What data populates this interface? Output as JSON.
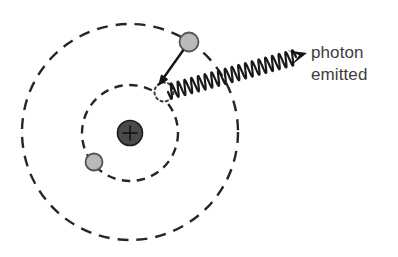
{
  "figure": {
    "background_color": "#ffffff",
    "width": 398,
    "height": 257
  },
  "labels": {
    "photon_line1": "photon",
    "photon_line2": "emitted",
    "nucleus_charge": "+"
  },
  "colors": {
    "orbit_stroke": "#262626",
    "nucleus_fill": "#4a4a4a",
    "nucleus_stroke": "#1c1c1c",
    "electron_fill": "#b9b9b9",
    "electron_stroke": "#555555",
    "ghost_stroke": "#3a3a3a",
    "wave_stroke": "#1a1a1a",
    "arrow_fill": "#141414",
    "text_color": "#3d3d3d"
  },
  "geometry": {
    "nucleus": {
      "cx": 130,
      "cy": 133,
      "r": 12.5
    },
    "orbits": [
      {
        "name": "inner-orbit",
        "cx": 130,
        "cy": 133,
        "r": 48,
        "dash": "8 6"
      },
      {
        "name": "outer-orbit",
        "cx": 130,
        "cy": 132,
        "r": 108,
        "dash": "10 8"
      }
    ],
    "electrons": [
      {
        "name": "electron-outer-upper",
        "cx": 189,
        "cy": 42,
        "r": 9.5
      },
      {
        "name": "electron-inner-lower",
        "cx": 94,
        "cy": 162,
        "r": 8.5
      }
    ],
    "ghost_electron": {
      "cx": 164,
      "cy": 92,
      "r": 9.5,
      "dash": "2.2 3.2"
    },
    "transition_arrow": {
      "x1": 183,
      "y1": 52,
      "x2": 158,
      "y2": 82
    },
    "photon_wave": {
      "start_x": 168,
      "start_y": 92,
      "end_x": 296,
      "end_y": 57,
      "amplitude": 7.5,
      "cycles": 19
    },
    "photon_arrowhead": {
      "tip_x": 307,
      "tip_y": 53
    }
  }
}
